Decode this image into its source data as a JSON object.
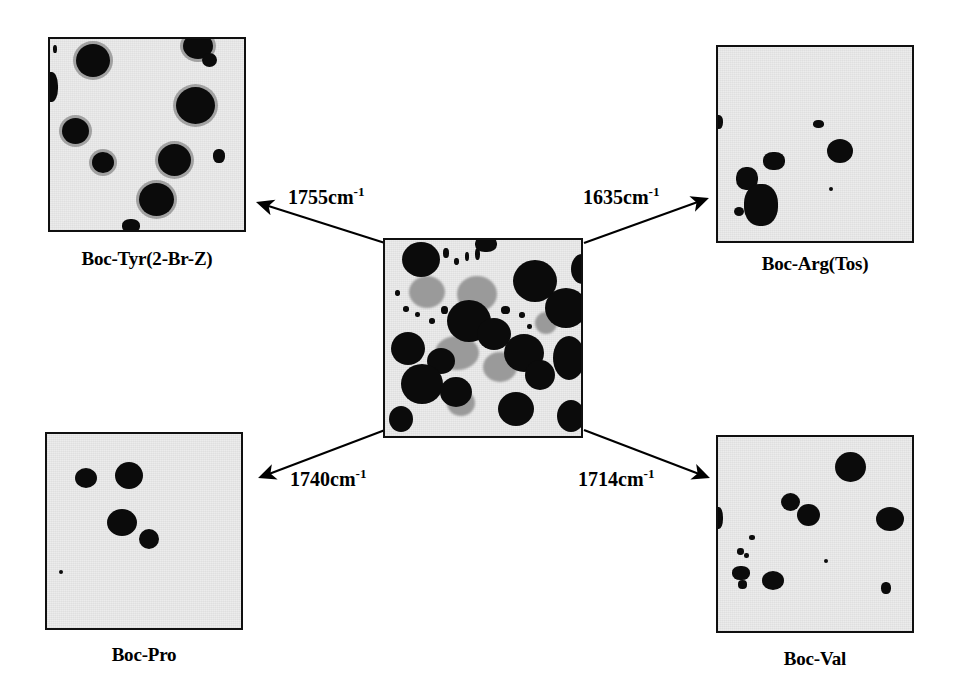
{
  "figure": {
    "background_color": "#ffffff",
    "ink_color": "#000000",
    "panel_background_color": "#ececec",
    "blob_color": "#0b0b0b",
    "gray_blob_color": "#9a9a9a",
    "panel_border_color": "#101010"
  },
  "center_panel": {
    "name": "composite-ir-image",
    "x": 383,
    "y": 238,
    "width": 200,
    "height": 200
  },
  "panels": [
    {
      "id": "top-left",
      "label": "Boc-Tyr(2-Br-Z)",
      "wavenumber": "1755cm",
      "wavenumber_superscript": "-1",
      "x": 48,
      "y": 37,
      "width": 198,
      "height": 195,
      "caption_y": 248
    },
    {
      "id": "top-right",
      "label": "Boc-Arg(Tos)",
      "wavenumber": "1635cm",
      "wavenumber_superscript": "-1",
      "x": 716,
      "y": 45,
      "width": 198,
      "height": 198,
      "caption_y": 253
    },
    {
      "id": "bottom-left",
      "label": "Boc-Pro",
      "wavenumber": "1740cm",
      "wavenumber_superscript": "-1",
      "x": 45,
      "y": 432,
      "width": 198,
      "height": 198,
      "caption_y": 644
    },
    {
      "id": "bottom-right",
      "label": "Boc-Val",
      "wavenumber": "1714cm",
      "wavenumber_superscript": "-1",
      "x": 716,
      "y": 435,
      "width": 198,
      "height": 198,
      "caption_y": 648
    }
  ],
  "annotations": [
    {
      "id": "ann-1755",
      "text": "1755cm",
      "sup": "-1",
      "x": 288,
      "y": 186
    },
    {
      "id": "ann-1635",
      "text": "1635cm",
      "sup": "-1",
      "x": 583,
      "y": 186
    },
    {
      "id": "ann-1740",
      "text": "1740cm",
      "sup": "-1",
      "x": 290,
      "y": 468
    },
    {
      "id": "ann-1714",
      "text": "1714cm",
      "sup": "-1",
      "x": 578,
      "y": 468
    }
  ],
  "arrows": [
    {
      "id": "arrow-to-top-left",
      "x1": 385,
      "y1": 243,
      "x2": 259,
      "y2": 203
    },
    {
      "id": "arrow-to-top-right",
      "x1": 584,
      "y1": 243,
      "x2": 706,
      "y2": 199
    },
    {
      "id": "arrow-to-bottom-left",
      "x1": 385,
      "y1": 430,
      "x2": 261,
      "y2": 477
    },
    {
      "id": "arrow-to-bottom-right",
      "x1": 584,
      "y1": 430,
      "x2": 707,
      "y2": 477
    }
  ],
  "blobs": {
    "top_left": [
      {
        "x": 26,
        "y": 5,
        "w": 34,
        "h": 33,
        "cls": "halo"
      },
      {
        "x": 133,
        "y": -6,
        "w": 30,
        "h": 26,
        "cls": "halo"
      },
      {
        "x": 152,
        "y": 14,
        "w": 15,
        "h": 14,
        "cls": ""
      },
      {
        "x": 126,
        "y": 48,
        "w": 39,
        "h": 37,
        "cls": "halo"
      },
      {
        "x": -6,
        "y": 33,
        "w": 14,
        "h": 30,
        "cls": "speck"
      },
      {
        "x": 12,
        "y": 79,
        "w": 27,
        "h": 26,
        "cls": "halo"
      },
      {
        "x": 42,
        "y": 113,
        "w": 22,
        "h": 21,
        "cls": "halo"
      },
      {
        "x": 108,
        "y": 105,
        "w": 33,
        "h": 32,
        "cls": "halo"
      },
      {
        "x": 163,
        "y": 110,
        "w": 12,
        "h": 14,
        "cls": "speck"
      },
      {
        "x": 89,
        "y": 144,
        "w": 35,
        "h": 33,
        "cls": "halo"
      },
      {
        "x": 72,
        "y": 180,
        "w": 18,
        "h": 14,
        "cls": "speck"
      },
      {
        "x": 3,
        "y": 6,
        "w": 4,
        "h": 8,
        "cls": "speck"
      }
    ],
    "top_right": [
      {
        "x": -4,
        "y": 68,
        "w": 9,
        "h": 14,
        "cls": "speck"
      },
      {
        "x": 95,
        "y": 73,
        "w": 11,
        "h": 8,
        "cls": "speck"
      },
      {
        "x": 109,
        "y": 92,
        "w": 26,
        "h": 24,
        "cls": ""
      },
      {
        "x": 45,
        "y": 105,
        "w": 22,
        "h": 18,
        "cls": "speck"
      },
      {
        "x": 18,
        "y": 120,
        "w": 22,
        "h": 23,
        "cls": "speck"
      },
      {
        "x": 26,
        "y": 137,
        "w": 34,
        "h": 42,
        "cls": "speck"
      },
      {
        "x": 16,
        "y": 160,
        "w": 10,
        "h": 9,
        "cls": ""
      },
      {
        "x": 111,
        "y": 140,
        "w": 4,
        "h": 4,
        "cls": ""
      }
    ],
    "bottom_left": [
      {
        "x": 28,
        "y": 34,
        "w": 22,
        "h": 20,
        "cls": ""
      },
      {
        "x": 68,
        "y": 28,
        "w": 28,
        "h": 27,
        "cls": ""
      },
      {
        "x": 60,
        "y": 75,
        "w": 30,
        "h": 27,
        "cls": ""
      },
      {
        "x": 92,
        "y": 95,
        "w": 20,
        "h": 20,
        "cls": ""
      },
      {
        "x": 12,
        "y": 136,
        "w": 4,
        "h": 4,
        "cls": ""
      }
    ],
    "bottom_right": [
      {
        "x": 117,
        "y": 15,
        "w": 31,
        "h": 30,
        "cls": ""
      },
      {
        "x": 63,
        "y": 56,
        "w": 19,
        "h": 18,
        "cls": ""
      },
      {
        "x": 79,
        "y": 67,
        "w": 23,
        "h": 22,
        "cls": ""
      },
      {
        "x": 158,
        "y": 70,
        "w": 28,
        "h": 24,
        "cls": ""
      },
      {
        "x": -4,
        "y": 70,
        "w": 9,
        "h": 22,
        "cls": "speck"
      },
      {
        "x": 31,
        "y": 98,
        "w": 6,
        "h": 5,
        "cls": "speck"
      },
      {
        "x": 19,
        "y": 111,
        "w": 7,
        "h": 7,
        "cls": "speck"
      },
      {
        "x": 26,
        "y": 116,
        "w": 5,
        "h": 5,
        "cls": "speck"
      },
      {
        "x": 14,
        "y": 129,
        "w": 18,
        "h": 14,
        "cls": "speck"
      },
      {
        "x": 20,
        "y": 143,
        "w": 9,
        "h": 9,
        "cls": "speck"
      },
      {
        "x": 44,
        "y": 134,
        "w": 22,
        "h": 19,
        "cls": ""
      },
      {
        "x": 163,
        "y": 145,
        "w": 10,
        "h": 12,
        "cls": "speck"
      },
      {
        "x": 106,
        "y": 122,
        "w": 4,
        "h": 4,
        "cls": ""
      }
    ],
    "center_dark": [
      {
        "x": 17,
        "y": 2,
        "w": 38,
        "h": 35,
        "cls": ""
      },
      {
        "x": 90,
        "y": -4,
        "w": 22,
        "h": 16,
        "cls": "speck"
      },
      {
        "x": 128,
        "y": 20,
        "w": 44,
        "h": 42,
        "cls": ""
      },
      {
        "x": 160,
        "y": 48,
        "w": 42,
        "h": 40,
        "cls": ""
      },
      {
        "x": 62,
        "y": 60,
        "w": 44,
        "h": 42,
        "cls": ""
      },
      {
        "x": 92,
        "y": 78,
        "w": 34,
        "h": 32,
        "cls": ""
      },
      {
        "x": 6,
        "y": 92,
        "w": 34,
        "h": 33,
        "cls": ""
      },
      {
        "x": 119,
        "y": 94,
        "w": 40,
        "h": 38,
        "cls": ""
      },
      {
        "x": 42,
        "y": 108,
        "w": 28,
        "h": 26,
        "cls": ""
      },
      {
        "x": 16,
        "y": 124,
        "w": 42,
        "h": 40,
        "cls": ""
      },
      {
        "x": 55,
        "y": 137,
        "w": 32,
        "h": 30,
        "cls": ""
      },
      {
        "x": 140,
        "y": 120,
        "w": 30,
        "h": 30,
        "cls": ""
      },
      {
        "x": 168,
        "y": 96,
        "w": 32,
        "h": 44,
        "cls": ""
      },
      {
        "x": 113,
        "y": 152,
        "w": 36,
        "h": 34,
        "cls": ""
      },
      {
        "x": 172,
        "y": 160,
        "w": 28,
        "h": 32,
        "cls": ""
      },
      {
        "x": 186,
        "y": 14,
        "w": 22,
        "h": 30,
        "cls": ""
      },
      {
        "x": 4,
        "y": 166,
        "w": 24,
        "h": 26,
        "cls": ""
      }
    ],
    "center_gray": [
      {
        "x": 24,
        "y": 36,
        "w": 36,
        "h": 32,
        "cls": "gray"
      },
      {
        "x": 72,
        "y": 36,
        "w": 40,
        "h": 36,
        "cls": "gray"
      },
      {
        "x": 50,
        "y": 96,
        "w": 44,
        "h": 34,
        "cls": "gray"
      },
      {
        "x": 98,
        "y": 112,
        "w": 34,
        "h": 30,
        "cls": "gray"
      },
      {
        "x": 150,
        "y": 72,
        "w": 22,
        "h": 22,
        "cls": "gray"
      },
      {
        "x": 62,
        "y": 150,
        "w": 28,
        "h": 26,
        "cls": "gray"
      }
    ],
    "center_specks": [
      {
        "x": 58,
        "y": 8,
        "w": 6,
        "h": 10,
        "cls": "speck"
      },
      {
        "x": 69,
        "y": 18,
        "w": 5,
        "h": 7,
        "cls": "speck"
      },
      {
        "x": 80,
        "y": 12,
        "w": 4,
        "h": 9,
        "cls": "speck"
      },
      {
        "x": 18,
        "y": 66,
        "w": 6,
        "h": 6,
        "cls": "speck"
      },
      {
        "x": 30,
        "y": 72,
        "w": 5,
        "h": 5,
        "cls": "speck"
      },
      {
        "x": 44,
        "y": 78,
        "w": 6,
        "h": 6,
        "cls": "speck"
      },
      {
        "x": 56,
        "y": 66,
        "w": 7,
        "h": 8,
        "cls": "speck"
      },
      {
        "x": 116,
        "y": 66,
        "w": 9,
        "h": 8,
        "cls": "speck"
      },
      {
        "x": 134,
        "y": 72,
        "w": 6,
        "h": 6,
        "cls": "speck"
      },
      {
        "x": 142,
        "y": 84,
        "w": 5,
        "h": 5,
        "cls": "speck"
      },
      {
        "x": 10,
        "y": 50,
        "w": 5,
        "h": 6,
        "cls": "speck"
      },
      {
        "x": 90,
        "y": 8,
        "w": 5,
        "h": 12,
        "cls": "speck"
      }
    ]
  }
}
